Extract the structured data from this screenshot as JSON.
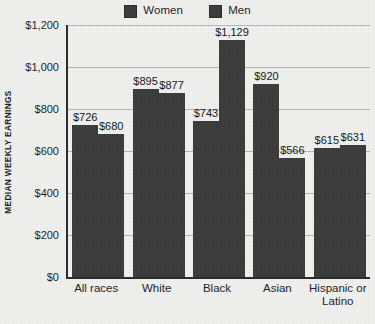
{
  "chart_data": {
    "type": "bar",
    "title": "",
    "subtitle": "",
    "xlabel": "",
    "ylabel": "MEDIAN WEEKLY EARNINGS",
    "ylim": [
      0,
      1200
    ],
    "ytick_step": 200,
    "grid": true,
    "legend_position": "top-center",
    "orientation": "vertical",
    "grouping": "grouped",
    "categories": [
      "All races",
      "White",
      "Black",
      "Asian",
      "Hispanic or Latino"
    ],
    "category_lines": [
      [
        "All races"
      ],
      [
        "White"
      ],
      [
        "Black"
      ],
      [
        "Asian"
      ],
      [
        "Hispanic or",
        "Latino"
      ]
    ],
    "series": [
      {
        "name": "Women",
        "color": "#3b3b3b",
        "values": [
          726,
          895,
          743,
          920,
          615
        ],
        "labels": [
          "$726",
          "$895",
          "$743",
          "$920",
          "$615"
        ]
      },
      {
        "name": "Men",
        "color": "#3b3b3b",
        "values": [
          680,
          877,
          1129,
          566,
          631
        ],
        "labels": [
          "$680",
          "$877",
          "$1,129",
          "$566",
          "$631"
        ]
      }
    ],
    "bars": [
      {
        "category": "All races",
        "series": "Women",
        "value": 726,
        "label": "$726"
      },
      {
        "category": "All races",
        "series": "Men",
        "value": 895,
        "label": "$895"
      },
      {
        "category": "White",
        "series": "Women",
        "value": 743,
        "label": "$743"
      },
      {
        "category": "White",
        "series": "Men",
        "value": 920,
        "label": "$920"
      },
      {
        "category": "Black",
        "series": "Women",
        "value": 615,
        "label": "$615"
      },
      {
        "category": "Black",
        "series": "Men",
        "value": 680,
        "label": "$680"
      },
      {
        "category": "Asian",
        "series": "Women",
        "value": 877,
        "label": "$877"
      },
      {
        "category": "Asian",
        "series": "Men",
        "value": 1129,
        "label": "$1,129"
      },
      {
        "category": "Hispanic or Latino",
        "series": "Women",
        "value": 566,
        "label": "$566"
      },
      {
        "category": "Hispanic or Latino",
        "series": "Men",
        "value": 631,
        "label": "$631"
      }
    ],
    "yticks": [
      0,
      200,
      400,
      600,
      800,
      1000,
      1200
    ],
    "ytick_labels": [
      "$0",
      "$200",
      "$400",
      "$600",
      "$800",
      "$1,000",
      "$1,200"
    ]
  },
  "legend": {
    "entries": [
      {
        "label": "Women",
        "color": "#3b3b3b"
      },
      {
        "label": "Men",
        "color": "#3b3b3b"
      }
    ]
  },
  "colors": {
    "background": "#efefed",
    "bar_fill": "#3b3b3b",
    "axis_line": "#2b2b2b",
    "gridline": "#b4b4b2",
    "text": "#1d1d1d"
  }
}
